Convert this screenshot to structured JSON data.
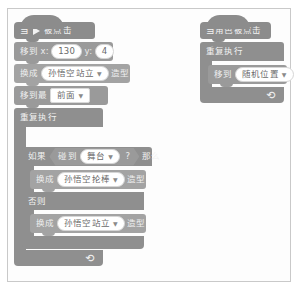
{
  "app": {
    "title": "Scratch 积木脚本",
    "background_color": "#ffffff",
    "frame_border_color": "#c9c9c9"
  },
  "palette": {
    "events_block": "#8c8c8c",
    "motion_block": "#9a9a9a",
    "looks_block": "#a3a3a3",
    "control_block": "#8f8f8f",
    "sensing_block": "#9a9a9a",
    "input_fill": "#ffffff",
    "text_color": "#5d5d5d"
  },
  "scripts": [
    {
      "id": "script-main",
      "blocks": {
        "when_flag_clicked": {
          "prefix": "当",
          "flag_icon": "green-flag-icon",
          "suffix": "被点击"
        },
        "goto_xy": {
          "label": "移到",
          "x_label": "x:",
          "x_value": "130",
          "y_label": "y:",
          "y_value": "4"
        },
        "switch_costume_1": {
          "prefix": "换成",
          "costume": "孙悟空站立",
          "dropdown_icon": "chevron-down-icon",
          "suffix": "造型"
        },
        "go_to_layer": {
          "prefix": "移到最",
          "layer": "前面",
          "dropdown_icon": "chevron-down-icon"
        },
        "forever": {
          "label": "重复执行",
          "loop_icon": "loop-arrow-icon"
        },
        "if_else": {
          "if_label": "如果",
          "condition_prefix": "碰到",
          "condition_target": "舞台",
          "condition_dropdown_icon": "chevron-down-icon",
          "condition_suffix": "?",
          "then_label": "那么",
          "else_label": "否则"
        },
        "switch_costume_if": {
          "prefix": "换成",
          "costume": "孙悟空抡棒",
          "dropdown_icon": "chevron-down-icon",
          "suffix": "造型"
        },
        "switch_costume_else": {
          "prefix": "换成",
          "costume": "孙悟空站立",
          "dropdown_icon": "chevron-down-icon",
          "suffix": "造型"
        }
      }
    },
    {
      "id": "script-sprite-clicked",
      "blocks": {
        "when_sprite_clicked": {
          "label": "当角色被点击"
        },
        "forever": {
          "label": "重复执行",
          "loop_icon": "loop-arrow-icon"
        },
        "goto_random": {
          "label": "移到",
          "target": "随机位置",
          "dropdown_icon": "chevron-down-icon"
        }
      }
    }
  ]
}
